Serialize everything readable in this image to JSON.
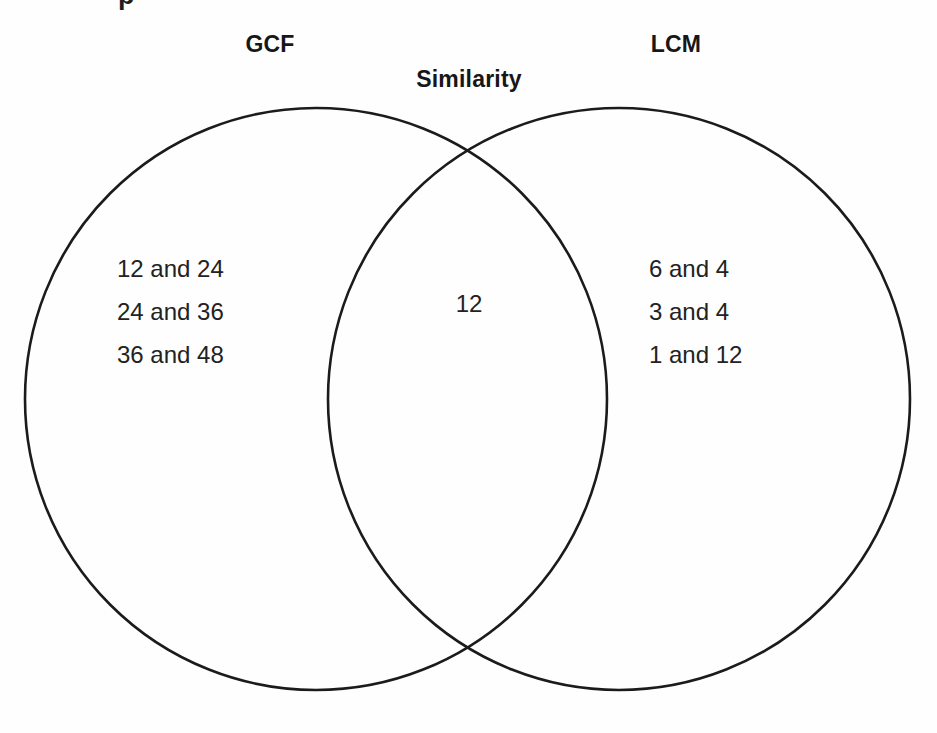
{
  "figure": {
    "type": "venn-diagram",
    "background_color": "#fefefe",
    "stroke_color": "#1b1b1b",
    "text_color": "#222222",
    "clipped_top_fragment": "p"
  },
  "headings": {
    "left_set": "GCF",
    "right_set": "LCM",
    "intersection": "Similarity"
  },
  "regions": {
    "left_only": {
      "label": "GCF",
      "items": [
        "12 and 24",
        "24 and 36",
        "36 and 48"
      ]
    },
    "intersection": {
      "label": "Similarity",
      "items": [
        "12"
      ]
    },
    "right_only": {
      "label": "LCM",
      "items": [
        "6 and 4",
        "3 and 4",
        "1 and 12"
      ]
    }
  },
  "geometry": {
    "left_circle": {
      "cx": 316,
      "cy": 399,
      "r": 291
    },
    "right_circle": {
      "cx": 619,
      "cy": 399,
      "r": 291
    }
  }
}
